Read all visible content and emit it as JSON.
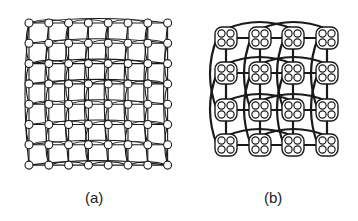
{
  "figure": {
    "panels": [
      {
        "id": "a",
        "caption": "(a)",
        "description": "8x8 mesh of nodes with row/column and long-range wraparound links",
        "grid": {
          "rows": 8,
          "cols": 8,
          "x0": 29,
          "y0": 23,
          "dx": 19.8,
          "dy": 20.3,
          "node_radius": 4
        }
      },
      {
        "id": "b",
        "caption": "(b)",
        "description": "4x4 mesh of clusters, each containing 4 nodes, with express links",
        "grid": {
          "rows": 4,
          "cols": 4,
          "xs": [
            226,
            260,
            293,
            327
          ],
          "ys": [
            38,
            73,
            110,
            145
          ],
          "cluster_size": 22,
          "nodes_per_cluster": 4
        }
      }
    ]
  },
  "colors": {
    "stroke": "#1a1a1a",
    "fill": "#ffffff",
    "caption": "#222222"
  }
}
